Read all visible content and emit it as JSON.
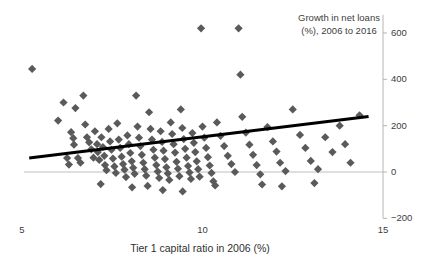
{
  "chart_data": {
    "type": "scatter",
    "title": "",
    "xlabel": "Tier 1 capital ratio in 2006 (%)",
    "ylabel": "Growth in net loans (%), 2006 to 2016",
    "xlim": [
      5,
      15
    ],
    "ylim": [
      -200,
      700
    ],
    "xticks": [
      5,
      10,
      15
    ],
    "xtick_labels": [
      "5",
      "10",
      "15"
    ],
    "yticks": [
      -200,
      0,
      200,
      400,
      600
    ],
    "ytick_labels": [
      "−200",
      "0",
      "200",
      "400",
      "600"
    ],
    "grid": false,
    "legend": false,
    "y_axis_position": "right",
    "marker": "diamond",
    "marker_color": "#5a5a5a",
    "marker_size": 7,
    "zero_line_color": "#bfbfbf",
    "trendline": {
      "type": "linear",
      "color": "#000000",
      "width": 3,
      "x_start": 5.2,
      "y_start": 60,
      "x_end": 14.6,
      "y_end": 240
    },
    "series": [
      {
        "name": "Banks",
        "points": [
          [
            5.28,
            445
          ],
          [
            6.15,
            300
          ],
          [
            6.48,
            276
          ],
          [
            6.0,
            222
          ],
          [
            6.36,
            172
          ],
          [
            6.42,
            146
          ],
          [
            6.44,
            118
          ],
          [
            6.7,
            330
          ],
          [
            6.75,
            205
          ],
          [
            6.8,
            150
          ],
          [
            6.86,
            128
          ],
          [
            6.92,
            98
          ],
          [
            6.55,
            60
          ],
          [
            6.62,
            40
          ],
          [
            6.98,
            62
          ],
          [
            7.02,
            176
          ],
          [
            7.08,
            120
          ],
          [
            7.1,
            86
          ],
          [
            7.14,
            52
          ],
          [
            7.2,
            150
          ],
          [
            7.24,
            108
          ],
          [
            7.28,
            70
          ],
          [
            7.3,
            30
          ],
          [
            7.34,
            8
          ],
          [
            7.4,
            186
          ],
          [
            7.44,
            132
          ],
          [
            7.48,
            96
          ],
          [
            7.52,
            58
          ],
          [
            7.56,
            24
          ],
          [
            7.6,
            -4
          ],
          [
            7.64,
            210
          ],
          [
            7.68,
            140
          ],
          [
            7.72,
            104
          ],
          [
            7.76,
            66
          ],
          [
            7.8,
            34
          ],
          [
            7.84,
            10
          ],
          [
            7.88,
            -22
          ],
          [
            7.92,
            158
          ],
          [
            7.96,
            120
          ],
          [
            8.0,
            82
          ],
          [
            8.04,
            46
          ],
          [
            8.08,
            18
          ],
          [
            8.12,
            -8
          ],
          [
            8.16,
            330
          ],
          [
            8.2,
            196
          ],
          [
            8.24,
            148
          ],
          [
            8.28,
            112
          ],
          [
            8.32,
            74
          ],
          [
            8.36,
            40
          ],
          [
            8.4,
            12
          ],
          [
            8.44,
            -16
          ],
          [
            8.48,
            -60
          ],
          [
            8.52,
            258
          ],
          [
            8.56,
            186
          ],
          [
            8.6,
            140
          ],
          [
            8.64,
            96
          ],
          [
            8.68,
            62
          ],
          [
            8.72,
            30
          ],
          [
            8.76,
            2
          ],
          [
            8.8,
            -26
          ],
          [
            8.84,
            176
          ],
          [
            8.88,
            130
          ],
          [
            8.92,
            92
          ],
          [
            8.96,
            56
          ],
          [
            9.0,
            20
          ],
          [
            9.04,
            -6
          ],
          [
            9.08,
            -34
          ],
          [
            9.12,
            214
          ],
          [
            9.16,
            164
          ],
          [
            9.2,
            120
          ],
          [
            9.24,
            84
          ],
          [
            9.28,
            44
          ],
          [
            9.32,
            14
          ],
          [
            9.36,
            -18
          ],
          [
            9.4,
            270
          ],
          [
            9.44,
            190
          ],
          [
            9.48,
            142
          ],
          [
            9.52,
            100
          ],
          [
            9.56,
            62
          ],
          [
            9.6,
            26
          ],
          [
            9.64,
            -2
          ],
          [
            9.68,
            -30
          ],
          [
            9.72,
            168
          ],
          [
            9.76,
            126
          ],
          [
            9.8,
            86
          ],
          [
            9.84,
            46
          ],
          [
            9.88,
            12
          ],
          [
            9.92,
            -20
          ],
          [
            9.96,
            620
          ],
          [
            10.0,
            196
          ],
          [
            10.05,
            148
          ],
          [
            10.1,
            104
          ],
          [
            10.15,
            64
          ],
          [
            10.2,
            28
          ],
          [
            10.25,
            -4
          ],
          [
            10.3,
            -40
          ],
          [
            10.4,
            214
          ],
          [
            10.5,
            156
          ],
          [
            10.6,
            112
          ],
          [
            10.7,
            70
          ],
          [
            10.8,
            34
          ],
          [
            10.9,
            0
          ],
          [
            11.0,
            620
          ],
          [
            11.05,
            420
          ],
          [
            11.1,
            238
          ],
          [
            11.2,
            170
          ],
          [
            11.3,
            118
          ],
          [
            11.4,
            74
          ],
          [
            11.5,
            30
          ],
          [
            11.6,
            -10
          ],
          [
            11.8,
            194
          ],
          [
            11.95,
            132
          ],
          [
            12.05,
            88
          ],
          [
            12.15,
            40
          ],
          [
            12.3,
            4
          ],
          [
            12.5,
            270
          ],
          [
            12.7,
            160
          ],
          [
            12.85,
            104
          ],
          [
            13.0,
            48
          ],
          [
            13.2,
            12
          ],
          [
            13.4,
            150
          ],
          [
            13.6,
            86
          ],
          [
            13.8,
            200
          ],
          [
            13.95,
            120
          ],
          [
            14.1,
            40
          ],
          [
            14.35,
            245
          ],
          [
            6.25,
            60
          ],
          [
            6.3,
            32
          ],
          [
            7.18,
            -52
          ],
          [
            8.05,
            -66
          ],
          [
            8.9,
            -78
          ],
          [
            9.45,
            -84
          ],
          [
            10.35,
            -58
          ],
          [
            11.65,
            -54
          ],
          [
            12.2,
            -62
          ],
          [
            13.1,
            -48
          ]
        ]
      }
    ]
  },
  "axes": {
    "y_title": "Growth in net loans (%), 2006 to 2016",
    "x_title": "Tier 1 capital ratio in 2006 (%)"
  }
}
